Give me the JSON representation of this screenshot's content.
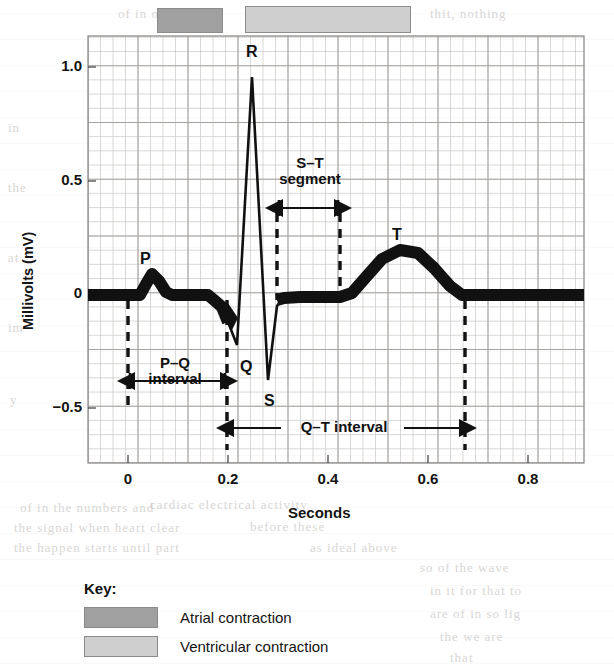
{
  "figure": {
    "axis": {
      "xlabel": "Seconds",
      "ylabel": "Millivolts (mV)",
      "xticks": [
        "0",
        "0.2",
        "0.4",
        "0.6",
        "0.8"
      ],
      "yticks": [
        "1.0",
        "0.5",
        "0",
        "−0.5"
      ]
    },
    "wave_labels": {
      "p": "P",
      "q": "Q",
      "r": "R",
      "s": "S",
      "t": "T"
    },
    "annotations": {
      "pq_line1": "P–Q",
      "pq_line2": "interval",
      "st_line1": "S–T",
      "st_line2": "segment",
      "qt": "Q–T interval"
    },
    "key": {
      "title": "Key:",
      "items": [
        {
          "label": "Atrial contraction",
          "color": "#a0a0a0"
        },
        {
          "label": "Ventricular contraction",
          "color": "#cfcfcf"
        }
      ]
    },
    "bars": {
      "atrial": {
        "color": "#a0a0a0"
      },
      "ventricular": {
        "color": "#cfcfcf"
      }
    },
    "ghost_text": [
      {
        "text": "of in one",
        "x": 118,
        "y": 6
      },
      {
        "text": "thit, nothing",
        "x": 430,
        "y": 6
      },
      {
        "text": "in",
        "x": 8,
        "y": 120
      },
      {
        "text": "the",
        "x": 8,
        "y": 180
      },
      {
        "text": "at",
        "x": 8,
        "y": 250
      },
      {
        "text": "im",
        "x": 8,
        "y": 320
      },
      {
        "text": "y",
        "x": 10,
        "y": 392
      },
      {
        "text": "cardiac electrical activity",
        "x": 150,
        "y": 497
      },
      {
        "text": "of in the   numbers and",
        "x": 20,
        "y": 500
      },
      {
        "text": "the signal when heart clear",
        "x": 14,
        "y": 520
      },
      {
        "text": "before these",
        "x": 250,
        "y": 519
      },
      {
        "text": "the happen starts   until part",
        "x": 14,
        "y": 540
      },
      {
        "text": "as ideal above",
        "x": 310,
        "y": 540
      },
      {
        "text": "so   of the wave",
        "x": 420,
        "y": 560
      },
      {
        "text": "in it for   that to",
        "x": 430,
        "y": 583
      },
      {
        "text": "are of   in so   lig",
        "x": 430,
        "y": 606
      },
      {
        "text": "the   we are",
        "x": 440,
        "y": 629
      },
      {
        "text": "that",
        "x": 450,
        "y": 650
      }
    ]
  },
  "chart_data": {
    "type": "line",
    "title": "",
    "xlabel": "Seconds",
    "ylabel": "Millivolts (mV)",
    "xlim": [
      -0.08,
      0.8
    ],
    "ylim": [
      -0.68,
      1.15
    ],
    "xticks": [
      0,
      0.2,
      0.4,
      0.6,
      0.8
    ],
    "yticks": [
      -0.5,
      0,
      0.5,
      1.0
    ],
    "grid": true,
    "grid_minor_spacing": {
      "x": 0.025,
      "y": 0.0625
    },
    "legend_position": "below-plot",
    "series": [
      {
        "name": "ECG trace",
        "x": [
          -0.08,
          0.0,
          0.02,
          0.04,
          0.06,
          0.08,
          0.1,
          0.14,
          0.17,
          0.185,
          0.195,
          0.205,
          0.215,
          0.225,
          0.235,
          0.245,
          0.255,
          0.268,
          0.28,
          0.3,
          0.34,
          0.38,
          0.42,
          0.46,
          0.5,
          0.54,
          0.58,
          0.6,
          0.64,
          0.72,
          0.8
        ],
        "y": [
          0.0,
          0.0,
          0.06,
          0.13,
          0.09,
          0.02,
          0.0,
          0.0,
          -0.02,
          -0.1,
          -0.2,
          -0.22,
          0.4,
          1.0,
          0.2,
          -0.37,
          -0.1,
          0.0,
          0.0,
          0.0,
          0.0,
          0.02,
          0.1,
          0.18,
          0.2,
          0.14,
          0.03,
          0.0,
          0.0,
          0.0,
          0.0
        ]
      }
    ],
    "annotations": [
      {
        "label": "P",
        "x": 0.04,
        "y": 0.15
      },
      {
        "label": "Q",
        "x": 0.205,
        "y": -0.28
      },
      {
        "label": "R",
        "x": 0.225,
        "y": 1.07
      },
      {
        "label": "S",
        "x": 0.245,
        "y": -0.44
      },
      {
        "label": "T",
        "x": 0.5,
        "y": 0.27
      },
      {
        "label": "P–Q interval",
        "x_start": 0.0,
        "x_end": 0.18,
        "y": -0.38
      },
      {
        "label": "S–T segment",
        "x_start": 0.3,
        "x_end": 0.365,
        "y": 0.42
      },
      {
        "label": "Q–T interval",
        "x_start": 0.18,
        "x_end": 0.6,
        "y": -0.57
      }
    ],
    "bars": [
      {
        "label": "Atrial contraction",
        "x_start": 0.055,
        "x_end": 0.19,
        "color": "#a0a0a0"
      },
      {
        "label": "Ventricular contraction",
        "x_start": 0.225,
        "x_end": 0.555,
        "color": "#cfcfcf"
      }
    ]
  }
}
